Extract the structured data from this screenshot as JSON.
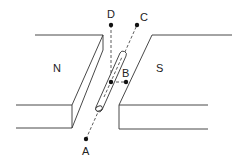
{
  "diagram": {
    "type": "physics-magnet-rod",
    "magnets": {
      "north": {
        "label": "N"
      },
      "south": {
        "label": "S"
      }
    },
    "points": {
      "A": {
        "label": "A"
      },
      "B": {
        "label": "B"
      },
      "C": {
        "label": "C"
      },
      "D": {
        "label": "D"
      }
    },
    "colors": {
      "stroke": "#333333",
      "background": "#ffffff"
    }
  }
}
